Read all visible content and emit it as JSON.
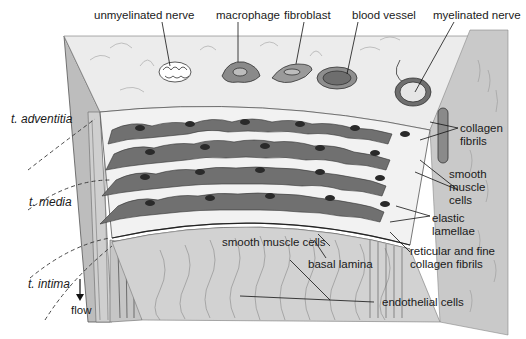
{
  "figure": {
    "top_labels": [
      {
        "id": "unmyelinated-nerve",
        "text": "unmyelinated nerve"
      },
      {
        "id": "macrophage",
        "text": "macrophage"
      },
      {
        "id": "fibroblast",
        "text": "fibroblast"
      },
      {
        "id": "blood-vessel",
        "text": "blood vessel"
      },
      {
        "id": "myelinated-nerve",
        "text": "myelinated nerve"
      }
    ],
    "layer_labels": [
      {
        "id": "t-adventitia",
        "text": "t. adventitia"
      },
      {
        "id": "t-media",
        "text": "t. media"
      },
      {
        "id": "t-intima",
        "text": "t. intima"
      }
    ],
    "right_labels": {
      "collagen_fibrils": [
        "collagen",
        "fibrils"
      ],
      "smooth_muscle_cells": [
        "smooth",
        "muscle",
        "cells"
      ],
      "elastic_lamellae": [
        "elastic",
        "lamellae"
      ],
      "reticular_fibrils": [
        "reticular and fine",
        "collagen fibrils"
      ]
    },
    "bottom_labels": {
      "smooth_muscle_cells": "smooth muscle cells",
      "basal_lamina": "basal lamina",
      "endothelial_cells": "endothelial cells"
    },
    "flow": {
      "label": "flow",
      "arrow": "down-arrow-icon"
    }
  },
  "colors": {
    "panel_light": "#e6e6e6",
    "panel_mid": "#cfcfcf",
    "panel_side": "#bdbdbd",
    "cell_fill": "#6e6e6e",
    "cell_nucleus": "#2e2e2e",
    "lamella": "#f4f4f4",
    "line": "#1a1a1a"
  }
}
